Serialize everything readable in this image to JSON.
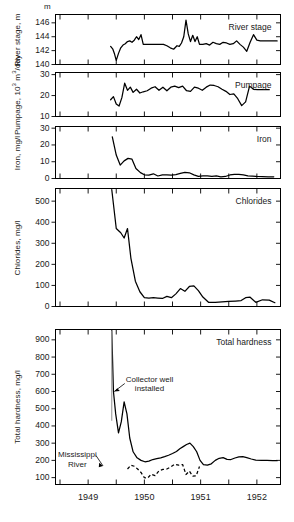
{
  "figure": {
    "top_unit_label": "m",
    "x_axis": {
      "tick_labels": [
        "1949",
        "1950",
        "1951",
        "1952"
      ],
      "tick_values": [
        1949,
        1950,
        1951,
        1952
      ],
      "minor_ticks": [
        1948.5,
        1949.5,
        1950.5,
        1951.5
      ],
      "range": [
        1948.42,
        1952.42
      ]
    },
    "annotations": [
      {
        "name": "collector-well-installed",
        "text_line1": "Collector well",
        "text_line2": "installed",
        "points_to_panel": "total_hardness",
        "points_to_value": 600,
        "event_x": 1949.42
      },
      {
        "name": "mississippi-river-label",
        "text_line1": "Mississippi",
        "text_line2": "River",
        "points_to_panel": "total_hardness",
        "series": "Mississippi River"
      }
    ]
  },
  "chart_data": [
    {
      "type": "line",
      "panel": "river_stage",
      "title": "River stage",
      "ylabel": "River stage, m",
      "yunit": "m",
      "ylim": [
        140,
        147.2
      ],
      "yticks": [
        140,
        142,
        144,
        146
      ],
      "xlabel": "",
      "grid": false,
      "series": [
        {
          "name": "River stage",
          "style": "solid",
          "x": [
            1949.4,
            1949.44,
            1949.47,
            1949.5,
            1949.54,
            1949.58,
            1949.62,
            1949.66,
            1949.7,
            1949.74,
            1949.78,
            1949.82,
            1949.86,
            1949.9,
            1949.94,
            1949.98,
            1950.04,
            1950.1,
            1950.18,
            1950.26,
            1950.34,
            1950.4,
            1950.46,
            1950.52,
            1950.58,
            1950.62,
            1950.66,
            1950.7,
            1950.74,
            1950.78,
            1950.82,
            1950.86,
            1950.9,
            1950.94,
            1950.98,
            1951.04,
            1951.1,
            1951.16,
            1951.22,
            1951.28,
            1951.34,
            1951.4,
            1951.46,
            1951.52,
            1951.58,
            1951.64,
            1951.7,
            1951.76,
            1951.82,
            1951.88,
            1951.94,
            1952.0,
            1952.06,
            1952.12,
            1952.18,
            1952.24,
            1952.3,
            1952.36
          ],
          "y": [
            142.6,
            142.2,
            141.5,
            140.6,
            141.6,
            142.4,
            142.8,
            143.0,
            143.3,
            143.4,
            143.2,
            143.5,
            144.0,
            143.6,
            144.3,
            142.9,
            142.9,
            142.9,
            142.9,
            142.9,
            142.9,
            142.7,
            142.4,
            142.2,
            142.7,
            142.6,
            143.1,
            144.0,
            146.4,
            144.4,
            143.3,
            144.2,
            143.3,
            144.0,
            142.9,
            142.9,
            143.0,
            142.8,
            143.2,
            143.0,
            142.9,
            143.2,
            143.1,
            142.9,
            143.0,
            143.4,
            142.9,
            142.5,
            141.9,
            143.2,
            144.3,
            143.5,
            143.4,
            143.4,
            143.4,
            143.4,
            143.4,
            143.4
          ]
        }
      ]
    },
    {
      "type": "line",
      "panel": "pumpage",
      "title": "Pumpage",
      "ylabel": "Pumpage, 10³ m³/day",
      "ylim": [
        10,
        31
      ],
      "yticks": [
        10,
        20,
        30
      ],
      "grid": false,
      "series": [
        {
          "name": "Pumpage",
          "style": "solid",
          "x": [
            1949.4,
            1949.45,
            1949.5,
            1949.55,
            1949.6,
            1949.65,
            1949.7,
            1949.75,
            1949.8,
            1949.86,
            1949.92,
            1949.98,
            1950.05,
            1950.12,
            1950.19,
            1950.26,
            1950.33,
            1950.4,
            1950.47,
            1950.54,
            1950.61,
            1950.68,
            1950.75,
            1950.82,
            1950.89,
            1950.96,
            1951.03,
            1951.1,
            1951.17,
            1951.24,
            1951.31,
            1951.38,
            1951.45,
            1951.52,
            1951.59,
            1951.66,
            1951.73,
            1951.8,
            1951.87,
            1951.94,
            1952.01,
            1952.08,
            1952.15,
            1952.22
          ],
          "y": [
            18.0,
            19.5,
            16.0,
            15.0,
            19.0,
            25.9,
            22.5,
            24.0,
            21.5,
            23.0,
            21.2,
            21.8,
            22.3,
            23.5,
            24.2,
            22.5,
            24.0,
            22.3,
            24.0,
            24.5,
            23.8,
            24.5,
            22.3,
            22.0,
            24.0,
            23.5,
            22.5,
            24.0,
            25.0,
            24.8,
            24.2,
            23.0,
            22.0,
            20.5,
            20.8,
            18.5,
            15.2,
            17.0,
            24.5,
            23.0,
            22.8,
            22.8,
            22.8,
            22.8
          ]
        }
      ]
    },
    {
      "type": "line",
      "panel": "iron",
      "title": "Iron",
      "ylabel": "Iron, mg/l",
      "ylim": [
        0,
        31
      ],
      "yticks": [
        0,
        10,
        20,
        30
      ],
      "grid": false,
      "series": [
        {
          "name": "Iron",
          "style": "solid",
          "x": [
            1949.43,
            1949.5,
            1949.57,
            1949.64,
            1949.71,
            1949.78,
            1949.85,
            1949.93,
            1950.0,
            1950.08,
            1950.16,
            1950.24,
            1950.32,
            1950.4,
            1950.48,
            1950.56,
            1950.64,
            1950.72,
            1950.8,
            1950.88,
            1950.96,
            1951.04,
            1951.12,
            1951.2,
            1951.28,
            1951.36,
            1951.44,
            1951.52,
            1951.6,
            1951.68,
            1951.76,
            1951.84,
            1951.92,
            1952.0,
            1952.1,
            1952.2,
            1952.3
          ],
          "y": [
            24.8,
            14.0,
            8.0,
            10.5,
            12.0,
            11.5,
            6.0,
            3.5,
            2.2,
            2.0,
            2.8,
            1.5,
            2.2,
            2.1,
            2.0,
            2.3,
            3.0,
            3.6,
            3.4,
            2.2,
            1.3,
            1.6,
            1.5,
            1.3,
            1.5,
            1.0,
            1.2,
            2.1,
            2.5,
            2.4,
            2.2,
            1.6,
            1.4,
            1.2,
            1.1,
            1.0,
            1.0
          ]
        }
      ]
    },
    {
      "type": "line",
      "panel": "chlorides",
      "title": "Chlorides",
      "ylabel": "Chlorides, mg/l",
      "ylim": [
        0,
        560
      ],
      "yticks": [
        0,
        100,
        200,
        300,
        400,
        500
      ],
      "grid": false,
      "series": [
        {
          "name": "Chlorides",
          "style": "solid",
          "x": [
            1949.42,
            1949.5,
            1949.58,
            1949.64,
            1949.7,
            1949.76,
            1949.84,
            1949.92,
            1950.0,
            1950.08,
            1950.16,
            1950.24,
            1950.32,
            1950.4,
            1950.48,
            1950.56,
            1950.64,
            1950.72,
            1950.8,
            1950.88,
            1950.96,
            1951.04,
            1951.14,
            1951.26,
            1951.38,
            1951.5,
            1951.62,
            1951.72,
            1951.8,
            1951.88,
            1951.98,
            1952.1,
            1952.22,
            1952.32
          ],
          "y": [
            555,
            370,
            350,
            325,
            370,
            230,
            120,
            70,
            42,
            40,
            42,
            40,
            38,
            48,
            42,
            60,
            85,
            72,
            95,
            98,
            75,
            45,
            20,
            20,
            22,
            24,
            26,
            28,
            42,
            44,
            20,
            32,
            30,
            18
          ]
        }
      ]
    },
    {
      "type": "line",
      "panel": "total_hardness",
      "title": "Total hardness",
      "ylabel": "Total hardness, mg/l",
      "ylim": [
        60,
        960
      ],
      "yticks": [
        100,
        200,
        300,
        400,
        500,
        600,
        700,
        800,
        900
      ],
      "grid": false,
      "series": [
        {
          "name": "Total hardness",
          "style": "solid",
          "x": [
            1949.42,
            1949.45,
            1949.49,
            1949.54,
            1949.59,
            1949.64,
            1949.69,
            1949.74,
            1949.8,
            1949.87,
            1949.94,
            1950.01,
            1950.08,
            1950.15,
            1950.22,
            1950.29,
            1950.36,
            1950.43,
            1950.5,
            1950.57,
            1950.63,
            1950.69,
            1950.75,
            1950.81,
            1950.87,
            1950.93,
            1950.99,
            1951.05,
            1951.12,
            1951.19,
            1951.26,
            1951.33,
            1951.4,
            1951.47,
            1951.54,
            1951.61,
            1951.68,
            1951.75,
            1951.82,
            1951.9,
            1951.98,
            1952.08,
            1952.18,
            1952.28,
            1952.36
          ],
          "y": [
            955,
            600,
            470,
            360,
            425,
            540,
            470,
            330,
            250,
            215,
            200,
            192,
            196,
            205,
            210,
            215,
            222,
            230,
            240,
            252,
            268,
            280,
            292,
            300,
            280,
            250,
            200,
            175,
            172,
            180,
            200,
            212,
            216,
            206,
            205,
            214,
            220,
            222,
            216,
            208,
            202,
            200,
            200,
            198,
            198
          ]
        },
        {
          "name": "Mississippi River",
          "style": "dashed",
          "x": [
            1949.7,
            1949.76,
            1949.82,
            1949.88,
            1949.94,
            1950.0,
            1950.06,
            1950.12,
            1950.19,
            1950.26,
            1950.33,
            1950.4,
            1950.47,
            1950.54,
            1950.61,
            1950.68,
            1950.74,
            1950.8,
            1950.86,
            1950.92,
            1950.98
          ],
          "y": [
            150,
            172,
            166,
            150,
            130,
            100,
            98,
            120,
            112,
            140,
            148,
            150,
            162,
            178,
            172,
            176,
            118,
            138,
            108,
            110,
            165
          ]
        }
      ]
    }
  ]
}
